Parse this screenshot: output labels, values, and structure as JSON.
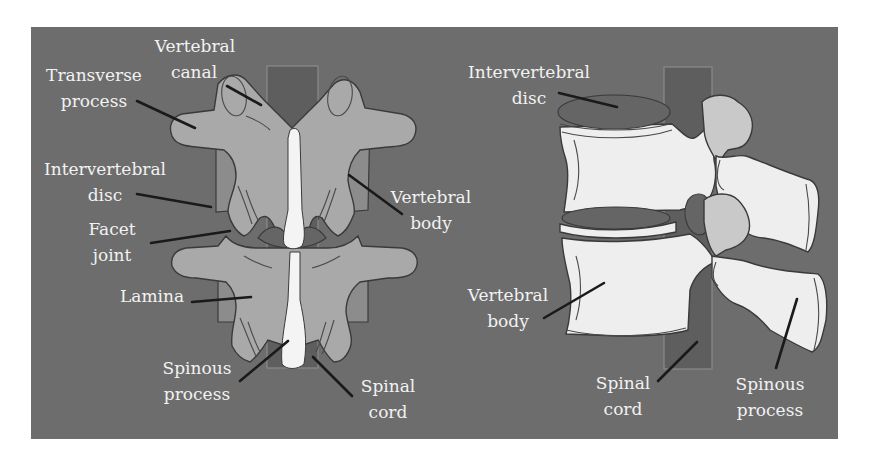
{
  "figure": {
    "colors": {
      "background": "#6d6d6d",
      "bone_posterior": "#a9a9a9",
      "bone_lateral": "#eeeeee",
      "disc": "#656565",
      "label_text": "#f2f2f2",
      "leader_line": "#1a1a1a"
    },
    "posterior_view": {
      "labels": {
        "vertebral_canal": [
          "Vertebral",
          "canal"
        ],
        "transverse_process": [
          "Transverse",
          "process"
        ],
        "intervertebral_disc": [
          "Intervertebral",
          "disc"
        ],
        "facet_joint": [
          "Facet",
          "joint"
        ],
        "lamina": [
          "Lamina"
        ],
        "spinous_process": [
          "Spinous",
          "process"
        ],
        "spinal_cord": [
          "Spinal",
          "cord"
        ],
        "vertebral_body": [
          "Vertebral",
          "body"
        ]
      }
    },
    "lateral_view": {
      "labels": {
        "intervertebral_disc": [
          "Intervertebral",
          "disc"
        ],
        "vertebral_body": [
          "Vertebral",
          "body"
        ],
        "spinal_cord": [
          "Spinal",
          "cord"
        ],
        "spinous_process": [
          "Spinous",
          "process"
        ]
      }
    }
  }
}
